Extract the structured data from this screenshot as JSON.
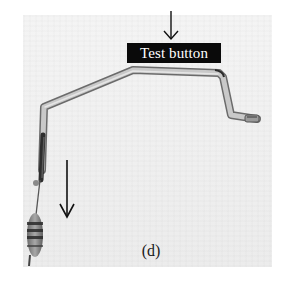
{
  "figure": {
    "panel_label": "(d)",
    "callout_label": "Test button",
    "annotations": [
      {
        "type": "arrow",
        "direction": "down",
        "points_to": "Test button",
        "x": 171,
        "y_start": 11,
        "y_end": 39
      },
      {
        "type": "arrow",
        "direction": "down",
        "x": 67,
        "y_start": 160,
        "y_end": 217
      }
    ],
    "photo": {
      "subject": "bent metal rod probe with resistor",
      "background_color": "#efefef",
      "rod_color": "#b8b8b8"
    }
  }
}
